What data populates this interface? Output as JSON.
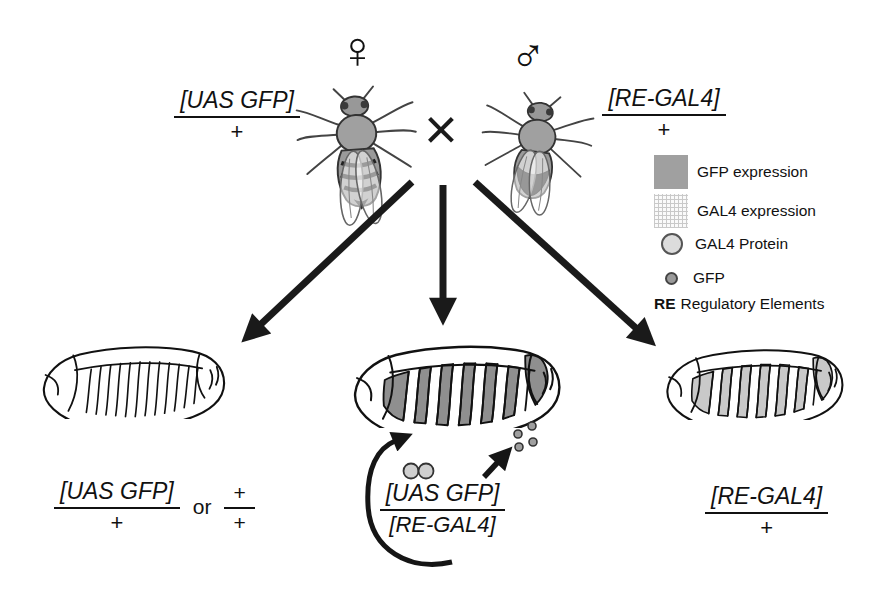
{
  "parents": {
    "female_symbol": "♀",
    "male_symbol": "♂",
    "cross_symbol": "×",
    "female_genotype": {
      "numerator": "[UAS GFP]",
      "denominator": "+"
    },
    "male_genotype": {
      "numerator": "[RE-GAL4]",
      "denominator": "+"
    }
  },
  "legend": {
    "items": [
      {
        "label": "GFP expression"
      },
      {
        "label": "GAL4 expression"
      },
      {
        "label": "GAL4 Protein"
      },
      {
        "label": "GFP"
      },
      {
        "abbr": "RE",
        "label": "Regulatory Elements"
      }
    ]
  },
  "offspring": {
    "left": {
      "frac1": {
        "numerator": "[UAS GFP]",
        "denominator": "+"
      },
      "conjunction": "or",
      "frac2": {
        "numerator": "+",
        "denominator": "+"
      }
    },
    "middle": {
      "frac": {
        "numerator": "[UAS GFP]",
        "denominator": "[RE-GAL4]"
      }
    },
    "right": {
      "frac": {
        "numerator": "[RE-GAL4]",
        "denominator": "+"
      }
    }
  },
  "colors": {
    "gfp_expression": "#8f8f8f",
    "gal4_expression": "#c9c9c9",
    "ink": "#1a1a1a"
  }
}
